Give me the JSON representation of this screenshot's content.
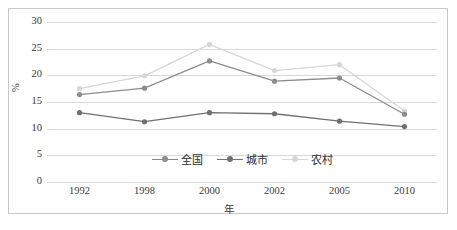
{
  "chart_data": {
    "type": "line",
    "title": "",
    "xlabel": "年",
    "ylabel": "%",
    "categories": [
      "1992",
      "1998",
      "2000",
      "2002",
      "2005",
      "2010"
    ],
    "ylim": [
      0,
      30
    ],
    "yticks": [
      0,
      5,
      10,
      15,
      20,
      25,
      30
    ],
    "grid": true,
    "legend_position": "inside-bottom-center",
    "series": [
      {
        "name": "全国",
        "color": "#8c8c8c",
        "values": [
          16.4,
          17.6,
          22.7,
          18.9,
          19.5,
          12.7
        ]
      },
      {
        "name": "城市",
        "color": "#707070",
        "values": [
          13.0,
          11.3,
          13.0,
          12.8,
          11.4,
          10.4
        ]
      },
      {
        "name": "农村",
        "color": "#d6d6d6",
        "values": [
          17.5,
          19.9,
          25.8,
          20.9,
          22.0,
          13.3
        ]
      }
    ]
  },
  "axis": {
    "y_tick_labels": [
      "30",
      "25",
      "20",
      "15",
      "10",
      "5",
      "0"
    ],
    "y_title": "%",
    "x_title": "年"
  },
  "colors": {
    "grid": "#d9d9d9",
    "frame": "#c8c8c8",
    "text": "#3a3a3a"
  }
}
